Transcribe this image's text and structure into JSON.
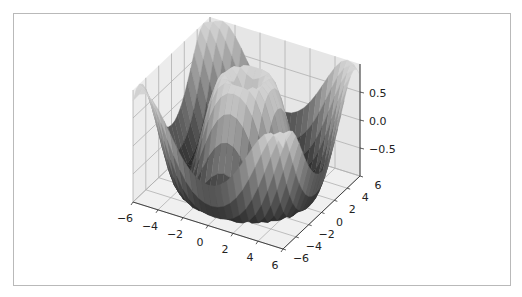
{
  "chart_data": {
    "type": "surface3d",
    "title": "",
    "function": "z = sin(sqrt(x^2 + y^2))",
    "colormap": "gray",
    "x": {
      "label": "",
      "range": [
        -6,
        6
      ],
      "ticks": [
        -6,
        -4,
        -2,
        0,
        2,
        4,
        6
      ],
      "tick_labels": [
        "−6",
        "−4",
        "−2",
        "0",
        "2",
        "4",
        "6"
      ]
    },
    "y": {
      "label": "",
      "range": [
        -6,
        6
      ],
      "ticks": [
        -6,
        -4,
        -2,
        0,
        2,
        4,
        6
      ],
      "tick_labels": [
        "−6",
        "−4",
        "−2",
        "0",
        "2",
        "4",
        "6"
      ]
    },
    "z": {
      "label": "",
      "range": [
        -1,
        1
      ],
      "ticks": [
        -0.5,
        0.0,
        0.5
      ],
      "tick_labels": [
        "−0.5",
        "0.0",
        "0.5"
      ]
    },
    "grid": true,
    "colors": {
      "pane": "#e6e6e6",
      "pane_side": "#ececec",
      "grid": "#b0b0b0",
      "axis": "#333333"
    }
  }
}
